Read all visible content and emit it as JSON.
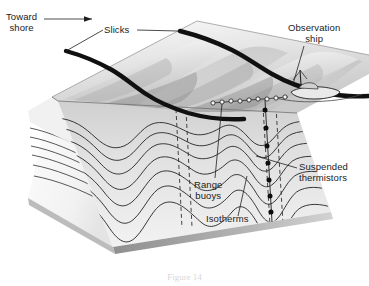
{
  "figure": {
    "kind": "oceanographic-block-diagram",
    "background_color": "#ffffff",
    "ink_color": "#1b1b1b"
  },
  "labels": {
    "toward_shore": "Toward\nshore",
    "slicks": "Slicks",
    "observation_ship": "Observation\nship",
    "suspended_thermistors": "Suspended\nthermistors",
    "range_buoys": "Range\nbuoys",
    "isotherms": "Isotherms"
  },
  "caption": {
    "text": "Figure 14"
  },
  "legend_items": [
    {
      "name": "toward-shore-arrow",
      "label": "Toward shore",
      "meaning": "direction of internal wave propagation"
    },
    {
      "name": "slicks",
      "label": "Slicks",
      "meaning": "dark surface bands of smooth water above internal wave troughs"
    },
    {
      "name": "observation-ship",
      "label": "Observation ship",
      "meaning": "surface vessel making the measurements"
    },
    {
      "name": "range-buoys",
      "label": "Range buoys",
      "meaning": "line of small floats marking a measurement range"
    },
    {
      "name": "suspended-thermistors",
      "label": "Suspended thermistors",
      "meaning": "temperature sensors hung at depth from the ship"
    },
    {
      "name": "isotherms",
      "label": "Isotherms",
      "meaning": "lines of equal water temperature, deformed by internal waves"
    }
  ],
  "colors": {
    "slick_band": "#101010",
    "top_surface_light": "#f4f4f4",
    "top_surface_mid": "#d9d9d9",
    "top_surface_dark": "#a8a8a8",
    "front_face": "#e2e2e2",
    "left_face": "#f6f6f6",
    "bottom_edge": "#9a9a9a",
    "thermistor_dot": "#0d0d0d",
    "dashed_line": "#2a2a2a",
    "isotherm_line": "#2b2b2b"
  },
  "counts": {
    "slick_bands": 2,
    "range_buoys": 9,
    "thermistors": 7,
    "isotherms_front": 7,
    "isotherms_left": 6,
    "dashed_verticals": 4
  }
}
